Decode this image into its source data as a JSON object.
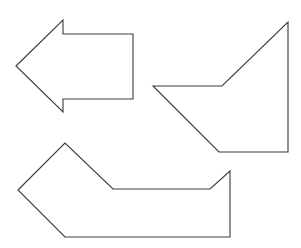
{
  "canvas": {
    "width": 301,
    "height": 248,
    "background": "#ffffff",
    "stroke": "#3a3a3a"
  },
  "shapes": [
    {
      "name": "left-arrow",
      "points": "16,66 63,20 63,34 133,34 133,99 63,99 63,112"
    },
    {
      "name": "right-quadrilateral",
      "points": "153,86 222,86 288,22 288,152 219,152"
    },
    {
      "name": "bottom-heptagon",
      "points": "18,190 65,143 113,189 210,189 230,171 230,237 65,237"
    }
  ]
}
